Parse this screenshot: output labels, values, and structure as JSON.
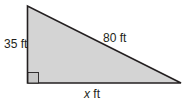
{
  "diagram": {
    "type": "right-triangle",
    "fill_color": "#d4d4d4",
    "stroke_color": "#231f20",
    "vertical_leg": {
      "label": "35 ft"
    },
    "hypotenuse": {
      "label": "80 ft"
    },
    "horizontal_leg": {
      "var": "x",
      "unit": " ft"
    },
    "right_angle_marker": true
  }
}
